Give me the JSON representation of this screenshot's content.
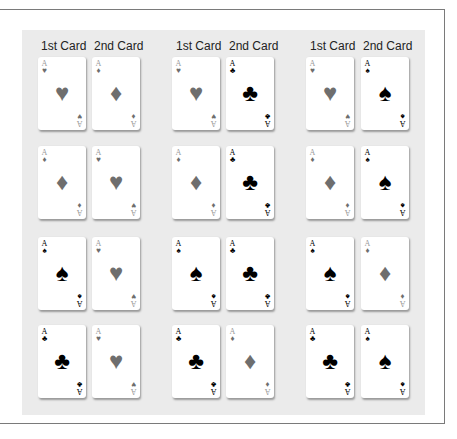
{
  "headers": {
    "g0c0": "1st Card",
    "g0c1": "2nd Card",
    "g1c0": "1st Card",
    "g1c1": "2nd Card",
    "g2c0": "1st Card",
    "g2c1": "2nd Card"
  },
  "suit_glyphs": {
    "heart": "♥",
    "diamond": "♦",
    "club": "♣",
    "spade": "♠"
  },
  "rank": "A",
  "rows": [
    [
      [
        "heart",
        "diamond"
      ],
      [
        "heart",
        "club"
      ],
      [
        "heart",
        "spade"
      ]
    ],
    [
      [
        "diamond",
        "heart"
      ],
      [
        "diamond",
        "club"
      ],
      [
        "diamond",
        "spade"
      ]
    ],
    [
      [
        "spade",
        "heart"
      ],
      [
        "spade",
        "club"
      ],
      [
        "spade",
        "diamond"
      ]
    ],
    [
      [
        "club",
        "heart"
      ],
      [
        "club",
        "diamond"
      ],
      [
        "club",
        "spade"
      ]
    ]
  ],
  "colors": {
    "panel": "#ebebeb",
    "frame": "#7a7a7a",
    "red_suit": "#6e6e6e",
    "black_suit": "#000000"
  }
}
